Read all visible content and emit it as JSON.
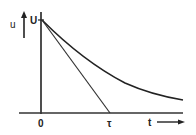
{
  "diagram": {
    "type": "exponential-decay-with-tangent",
    "y_axis": {
      "label": "u",
      "arrow_label": "up-arrow"
    },
    "x_axis": {
      "label": "t",
      "arrow_label": "right-arrow"
    },
    "labels": {
      "initial_value": "U",
      "origin": "0",
      "time_constant": "τ",
      "y_axis_label": "u",
      "x_axis_label": "t"
    },
    "curve": {
      "description": "u = U·e^(-t/τ)",
      "start": "U at t=0"
    },
    "tangent": {
      "description": "initial tangent intersecting t-axis at τ"
    },
    "colors": {
      "stroke": "#222222",
      "background": "#ffffff"
    }
  }
}
